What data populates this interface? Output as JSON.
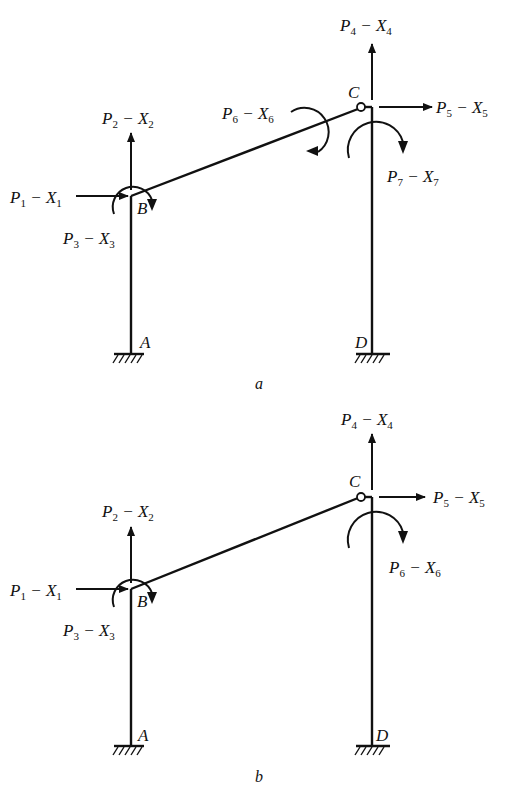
{
  "figures": [
    {
      "id": "a",
      "caption": "a",
      "nodes": {
        "A": "A",
        "B": "B",
        "C": "C",
        "D": "D"
      },
      "loads": [
        {
          "P": "P",
          "Pi": "1",
          "X": "X",
          "Xi": "1",
          "type": "horizontal-force",
          "node": "B"
        },
        {
          "P": "P",
          "Pi": "2",
          "X": "X",
          "Xi": "2",
          "type": "vertical-force",
          "node": "B"
        },
        {
          "P": "P",
          "Pi": "3",
          "X": "X",
          "Xi": "3",
          "type": "moment",
          "node": "B"
        },
        {
          "P": "P",
          "Pi": "4",
          "X": "X",
          "Xi": "4",
          "type": "vertical-force",
          "node": "C"
        },
        {
          "P": "P",
          "Pi": "5",
          "X": "X",
          "Xi": "5",
          "type": "horizontal-force",
          "node": "C"
        },
        {
          "P": "P",
          "Pi": "6",
          "X": "X",
          "Xi": "6",
          "type": "moment",
          "node": "C-beam-end"
        },
        {
          "P": "P",
          "Pi": "7",
          "X": "X",
          "Xi": "7",
          "type": "moment",
          "node": "C-column-top"
        }
      ]
    },
    {
      "id": "b",
      "caption": "b",
      "nodes": {
        "A": "A",
        "B": "B",
        "C": "C",
        "D": "D"
      },
      "loads": [
        {
          "P": "P",
          "Pi": "1",
          "X": "X",
          "Xi": "1",
          "type": "horizontal-force",
          "node": "B"
        },
        {
          "P": "P",
          "Pi": "2",
          "X": "X",
          "Xi": "2",
          "type": "vertical-force",
          "node": "B"
        },
        {
          "P": "P",
          "Pi": "3",
          "X": "X",
          "Xi": "3",
          "type": "moment",
          "node": "B"
        },
        {
          "P": "P",
          "Pi": "4",
          "X": "X",
          "Xi": "4",
          "type": "vertical-force",
          "node": "C"
        },
        {
          "P": "P",
          "Pi": "5",
          "X": "X",
          "Xi": "5",
          "type": "horizontal-force",
          "node": "C"
        },
        {
          "P": "P",
          "Pi": "6",
          "X": "X",
          "Xi": "6",
          "type": "moment",
          "node": "C-column-top"
        }
      ]
    }
  ],
  "dash": "−"
}
